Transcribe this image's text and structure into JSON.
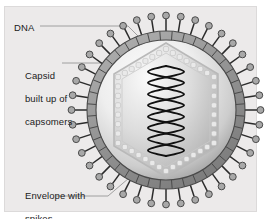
{
  "figure": {
    "kind": "scientific-diagram",
    "panel_bg": "#eceaea",
    "panel_border": "#dcdada"
  },
  "labels": {
    "dna": "DNA",
    "capsid_line1": "Capsid",
    "capsid_line2": "built up of",
    "capsid_line3": "capsomers",
    "envelope_line1": "Envelope with",
    "envelope_line2": "spikes"
  },
  "structures": {
    "envelope": {
      "name": "envelope-ring",
      "color": "#9a9a9a",
      "stroke": "#4a4a4a",
      "segments": 40
    },
    "spikes": {
      "name": "spike",
      "count": 40,
      "stem_color": "#2b2b2b",
      "knob_fill": "#a8a8a8",
      "knob_stroke": "#4a4a4a"
    },
    "interior": {
      "name": "viral-interior",
      "highlight": "#fdfdfd",
      "shadow": "#9d9d9d"
    },
    "capsid": {
      "name": "capsid-hexagon",
      "fill": "#d3d3d3",
      "stroke": "#b5b5b5",
      "capsomers": 36,
      "capsomer_fill": "#e9e9e9"
    },
    "dna": {
      "name": "dna-double-helix",
      "color": "#111111",
      "turns": 4
    }
  },
  "leaders": {
    "dna_line": "DNA leader line to capsid apex",
    "capsid_line": "Capsid leader line to capsid edge",
    "envelope_line": "Envelope leader line to envelope ring"
  },
  "colors": {
    "text": "#1b1b1b",
    "leader": "#8d8d8d",
    "background": "#ffffff"
  }
}
